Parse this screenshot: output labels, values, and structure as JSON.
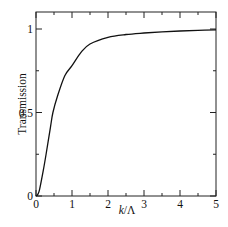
{
  "chart_data": {
    "type": "line",
    "title": "",
    "xlabel": "k/Λ",
    "xlabel_parts": {
      "var": "k",
      "slash": "/",
      "denom": "Λ"
    },
    "ylabel": "Transmission",
    "xlim": [
      0,
      5
    ],
    "ylim": [
      0,
      1.0
    ],
    "x_ticks": [
      0,
      1,
      2,
      3,
      4,
      5
    ],
    "x_tick_labels": [
      "0",
      "1",
      "2",
      "3",
      "4",
      "5"
    ],
    "x_minor_step": 0.5,
    "y_ticks": [
      0,
      0.5,
      1
    ],
    "y_tick_labels": [
      "0",
      "0.5",
      "1"
    ],
    "y_minor_step": 0.25,
    "grid": false,
    "legend": null,
    "series": [
      {
        "name": "Transmission",
        "color": "#111111",
        "x": [
          0,
          0.05,
          0.1,
          0.2,
          0.28,
          0.4,
          0.47,
          0.6,
          0.8,
          1.0,
          1.25,
          1.5,
          2.0,
          2.5,
          3.0,
          3.5,
          4.0,
          4.5,
          5.0
        ],
        "y": [
          0,
          0.01,
          0.04,
          0.15,
          0.25,
          0.41,
          0.5,
          0.6,
          0.72,
          0.78,
          0.86,
          0.91,
          0.95,
          0.967,
          0.976,
          0.983,
          0.988,
          0.992,
          0.995
        ]
      }
    ]
  }
}
